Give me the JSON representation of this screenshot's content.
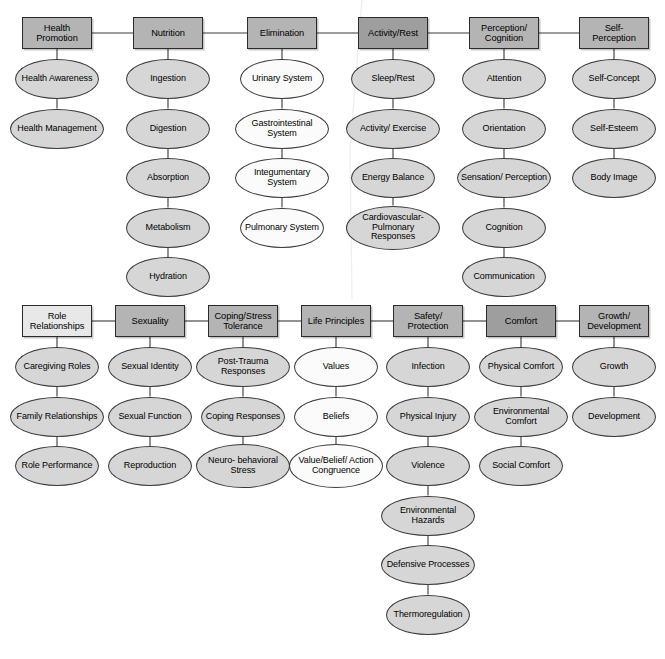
{
  "figure": {
    "type": "hierarchy-diagram",
    "colors": {
      "domain_dark": "#9e9e9e",
      "domain_medium": "#b4b4b4",
      "domain_light": "#e8e8e8",
      "class_gray": "#d6d6d6",
      "class_white": "#fbfbfb",
      "stroke": "#2b2b2b",
      "background": "#ffffff"
    }
  },
  "rows": [
    {
      "row_index": 0,
      "domains": [
        {
          "id": "health-promotion",
          "label": "Health Promotion",
          "shade": "domain_medium",
          "class_shade": "class_gray",
          "classes": [
            "Health Awareness",
            "Health Management"
          ]
        },
        {
          "id": "nutrition",
          "label": "Nutrition",
          "shade": "domain_medium",
          "class_shade": "class_gray",
          "classes": [
            "Ingestion",
            "Digestion",
            "Absorption",
            "Metabolism",
            "Hydration"
          ]
        },
        {
          "id": "elimination",
          "label": "Elimination",
          "shade": "domain_medium",
          "class_shade": "class_white",
          "classes": [
            "Urinary System",
            "Gastrointestinal System",
            "Integumentary System",
            "Pulmonary System"
          ]
        },
        {
          "id": "activity-rest",
          "label": "Activity/Rest",
          "shade": "domain_dark",
          "class_shade": "class_gray",
          "classes": [
            "Sleep/Rest",
            "Activity/ Exercise",
            "Energy Balance",
            "Cardiovascular- Pulmonary Responses"
          ]
        },
        {
          "id": "perception-cognition",
          "label": "Perception/ Cognition",
          "shade": "domain_medium",
          "class_shade": "class_gray",
          "classes": [
            "Attention",
            "Orientation",
            "Sensation/ Perception",
            "Cognition",
            "Communication"
          ]
        },
        {
          "id": "self-perception",
          "label": "Self- Perception",
          "shade": "domain_medium",
          "class_shade": "class_gray",
          "classes": [
            "Self-Concept",
            "Self-Esteem",
            "Body Image"
          ]
        }
      ]
    },
    {
      "row_index": 1,
      "domains": [
        {
          "id": "role-relationships",
          "label": "Role Relationships",
          "shade": "domain_light",
          "class_shade": "class_gray",
          "classes": [
            "Caregiving Roles",
            "Family Relationships",
            "Role Performance"
          ]
        },
        {
          "id": "sexuality",
          "label": "Sexuality",
          "shade": "domain_medium",
          "class_shade": "class_gray",
          "classes": [
            "Sexual Identity",
            "Sexual Function",
            "Reproduction"
          ]
        },
        {
          "id": "coping-stress-tolerance",
          "label": "Coping/Stress Tolerance",
          "shade": "domain_medium",
          "class_shade": "class_gray",
          "classes": [
            "Post-Trauma Responses",
            "Coping Responses",
            "Neuro- behavioral Stress"
          ]
        },
        {
          "id": "life-principles",
          "label": "Life Principles",
          "shade": "domain_medium",
          "class_shade": "class_white",
          "classes": [
            "Values",
            "Beliefs",
            "Value/Belief/ Action Congruence"
          ]
        },
        {
          "id": "safety-protection",
          "label": "Safety/ Protection",
          "shade": "domain_medium",
          "class_shade": "class_gray",
          "classes": [
            "Infection",
            "Physical Injury",
            "Violence",
            "Environmental Hazards",
            "Defensive Processes",
            "Thermoregulation"
          ]
        },
        {
          "id": "comfort",
          "label": "Comfort",
          "shade": "domain_dark",
          "class_shade": "class_gray",
          "classes": [
            "Physical Comfort",
            "Environmental Comfort",
            "Social Comfort"
          ]
        },
        {
          "id": "growth-development",
          "label": "Growth/ Development",
          "shade": "domain_medium",
          "class_shade": "class_gray",
          "classes": [
            "Growth",
            "Development"
          ]
        }
      ]
    }
  ]
}
